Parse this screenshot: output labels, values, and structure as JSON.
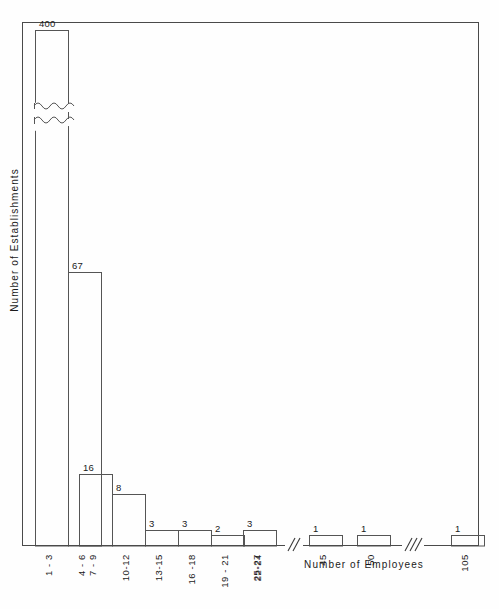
{
  "chart_data": {
    "type": "bar",
    "title": "",
    "subtitle": "",
    "xlabel": "Number of Employees",
    "ylabel": "Number of Establishments",
    "grid": false,
    "legend": "none",
    "ylim": [
      0,
      75
    ],
    "y_axis_truncated": true,
    "y_axis_break_note": "first bar broken with wavy line; true value 400",
    "x_axis_breaks": 2,
    "categories": [
      "1 - 3",
      "4 - 6",
      "7 - 9",
      "10-12",
      "13-15",
      "16 -18",
      "19 - 21",
      "22-24",
      "25-27",
      "45",
      "50",
      "105"
    ],
    "values": [
      400,
      67,
      16,
      8,
      3,
      3,
      2,
      0,
      3,
      1,
      1,
      1
    ],
    "value_labels": [
      "400",
      "67",
      "16",
      "8",
      "3",
      "3",
      "2",
      "",
      "3",
      "1",
      "1",
      "1"
    ],
    "bars": [
      {
        "label": "1 - 3",
        "value": 400,
        "value_label": "400",
        "x": 35,
        "width": 33,
        "top": 30,
        "truncated": true
      },
      {
        "label": "4 - 6",
        "value": 67,
        "value_label": "67",
        "x": 68,
        "width": 33,
        "top": 272,
        "truncated": false
      },
      {
        "label": "7 - 9",
        "value": 16,
        "value_label": "16",
        "x": 79,
        "width": 33,
        "top": 474,
        "truncated": false
      },
      {
        "label": "10-12",
        "value": 8,
        "value_label": "8",
        "x": 112,
        "width": 33,
        "top": 494,
        "truncated": false
      },
      {
        "label": "13-15",
        "value": 3,
        "value_label": "3",
        "x": 145,
        "width": 33,
        "top": 530,
        "truncated": false
      },
      {
        "label": "16 -18",
        "value": 3,
        "value_label": "3",
        "x": 178,
        "width": 33,
        "top": 530,
        "truncated": false
      },
      {
        "label": "19 - 21",
        "value": 2,
        "value_label": "2",
        "x": 211,
        "width": 33,
        "top": 535,
        "truncated": false
      },
      {
        "label": "22-24",
        "value": 0,
        "value_label": "",
        "x": 244,
        "width": 33,
        "top": 546,
        "truncated": false
      },
      {
        "label": "25-27",
        "value": 3,
        "value_label": "3",
        "x": 243,
        "width": 33,
        "top": 530,
        "truncated": false
      },
      {
        "label": "45",
        "value": 1,
        "value_label": "1",
        "x": 309,
        "width": 33,
        "top": 535,
        "truncated": false
      },
      {
        "label": "50",
        "value": 1,
        "value_label": "1",
        "x": 357,
        "width": 33,
        "top": 535,
        "truncated": false
      },
      {
        "label": "105",
        "value": 1,
        "value_label": "1",
        "x": 451,
        "width": 33,
        "top": 535,
        "truncated": false
      }
    ]
  },
  "axes": {
    "y_title": "Number of Establishments",
    "x_title": "Number of Employees"
  },
  "colors": {
    "background": "#fefefe",
    "line": "#4a4a4a",
    "bar_stroke": "#555555",
    "text": "#1a1a1a"
  }
}
